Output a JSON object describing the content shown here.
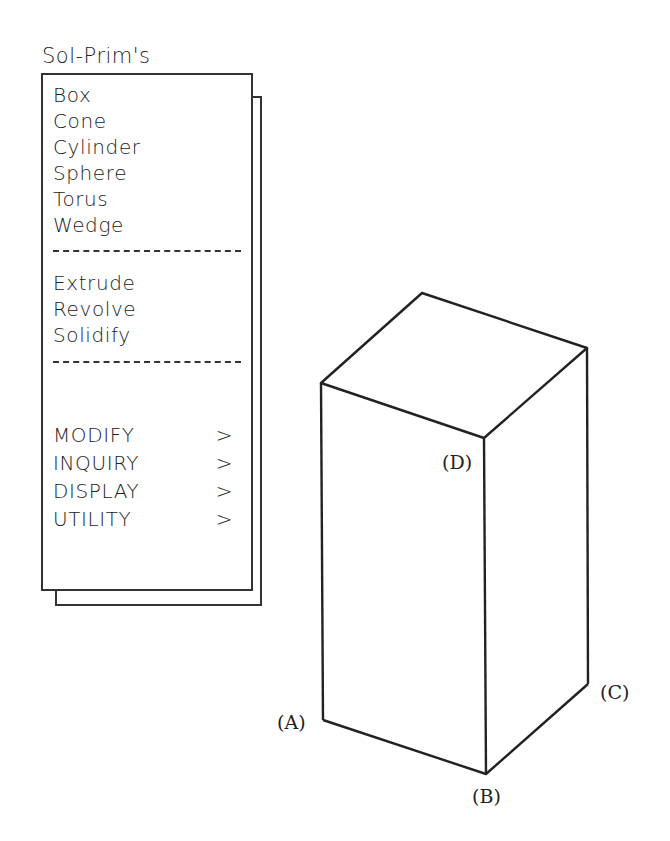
{
  "menu": {
    "title": "Sol-Prim's",
    "primitives": [
      "Box",
      "Cone",
      "Cylinder",
      "Sphere",
      "Torus",
      "Wedge"
    ],
    "operations": [
      "Extrude",
      "Revolve",
      "Solidify"
    ],
    "submenus": [
      {
        "label": "MODIFY",
        "arrow": ">"
      },
      {
        "label": "INQUIRY",
        "arrow": ">"
      },
      {
        "label": "DISPLAY",
        "arrow": ">"
      },
      {
        "label": "UTILITY",
        "arrow": ">"
      }
    ]
  },
  "figure": {
    "labels": {
      "a": "(A)",
      "b": "(B)",
      "c": "(C)",
      "d": "(D)"
    }
  }
}
